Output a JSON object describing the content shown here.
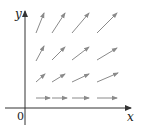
{
  "diagram": {
    "title": "",
    "type": "vector field",
    "axes": {
      "x_label": "x",
      "y_label": "y",
      "origin_label": "0",
      "axis_color": "#333333"
    },
    "arrow_color": "#8a8a8a",
    "arrows": [
      {
        "x1": 36,
        "y1": 98,
        "x2": 50,
        "y2": 98
      },
      {
        "x1": 52,
        "y1": 98,
        "x2": 67,
        "y2": 98
      },
      {
        "x1": 72,
        "y1": 98,
        "x2": 89,
        "y2": 98
      },
      {
        "x1": 97,
        "y1": 98,
        "x2": 117,
        "y2": 98
      },
      {
        "x1": 36,
        "y1": 82,
        "x2": 45,
        "y2": 74
      },
      {
        "x1": 52,
        "y1": 82,
        "x2": 65,
        "y2": 74
      },
      {
        "x1": 72,
        "y1": 82,
        "x2": 89,
        "y2": 74
      },
      {
        "x1": 97,
        "y1": 82,
        "x2": 118,
        "y2": 73
      },
      {
        "x1": 36,
        "y1": 61,
        "x2": 44,
        "y2": 46
      },
      {
        "x1": 52,
        "y1": 60,
        "x2": 65,
        "y2": 47
      },
      {
        "x1": 72,
        "y1": 60,
        "x2": 89,
        "y2": 47
      },
      {
        "x1": 97,
        "y1": 60,
        "x2": 117,
        "y2": 48
      },
      {
        "x1": 36,
        "y1": 33,
        "x2": 44,
        "y2": 13
      },
      {
        "x1": 52,
        "y1": 33,
        "x2": 65,
        "y2": 13
      },
      {
        "x1": 72,
        "y1": 33,
        "x2": 89,
        "y2": 13
      },
      {
        "x1": 97,
        "y1": 33,
        "x2": 117,
        "y2": 13
      }
    ]
  }
}
